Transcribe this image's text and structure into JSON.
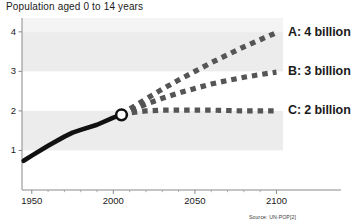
{
  "chart_data": {
    "type": "line",
    "title": "Population aged 0 to 14 years",
    "xlabel": "",
    "ylabel": "",
    "xlim": [
      1944,
      2104
    ],
    "ylim": [
      0,
      4.35
    ],
    "grid": false,
    "bands": "alternating light grey horizontal bands between y gridlines",
    "legend_position": "right-inline-end-of-line",
    "source": "Source: UN-POP[2]",
    "x_ticks": [
      1950,
      2000,
      2050,
      2100
    ],
    "x_tick_labels": [
      "1950",
      "2000",
      "2050",
      "2100"
    ],
    "x_minor_tick_step": 10,
    "y_ticks": [
      1,
      2,
      3,
      4
    ],
    "y_tick_labels": [
      "1",
      "2",
      "3",
      "4"
    ],
    "branch_point": {
      "x": 2005,
      "y": 1.9,
      "marker": "open-circle"
    },
    "series": [
      {
        "name": "Historical",
        "label": "",
        "style": "solid",
        "color": "#111111",
        "x": [
          1945,
          1950,
          1960,
          1970,
          1975,
          1980,
          1990,
          2000,
          2005
        ],
        "values": [
          0.74,
          0.87,
          1.12,
          1.35,
          1.45,
          1.52,
          1.65,
          1.83,
          1.9
        ]
      },
      {
        "name": "A",
        "label": "A: 4 billion",
        "style": "dashed",
        "color": "#555555",
        "x": [
          2005,
          2010,
          2020,
          2030,
          2040,
          2050,
          2060,
          2070,
          2080,
          2090,
          2100
        ],
        "values": [
          1.9,
          2.05,
          2.3,
          2.55,
          2.78,
          3.0,
          3.22,
          3.42,
          3.62,
          3.8,
          3.98
        ]
      },
      {
        "name": "B",
        "label": "B: 3 billion",
        "style": "dashed",
        "color": "#555555",
        "x": [
          2005,
          2010,
          2020,
          2030,
          2040,
          2050,
          2060,
          2070,
          2080,
          2090,
          2100
        ],
        "values": [
          1.9,
          2.0,
          2.17,
          2.32,
          2.45,
          2.57,
          2.68,
          2.77,
          2.85,
          2.92,
          2.98
        ]
      },
      {
        "name": "C",
        "label": "C: 2 billion",
        "style": "dashed",
        "color": "#555555",
        "x": [
          2005,
          2010,
          2020,
          2030,
          2040,
          2050,
          2060,
          2070,
          2080,
          2090,
          2100
        ],
        "values": [
          1.9,
          1.95,
          2.0,
          2.02,
          2.02,
          2.02,
          2.02,
          2.01,
          2.0,
          2.0,
          2.0
        ]
      }
    ]
  }
}
